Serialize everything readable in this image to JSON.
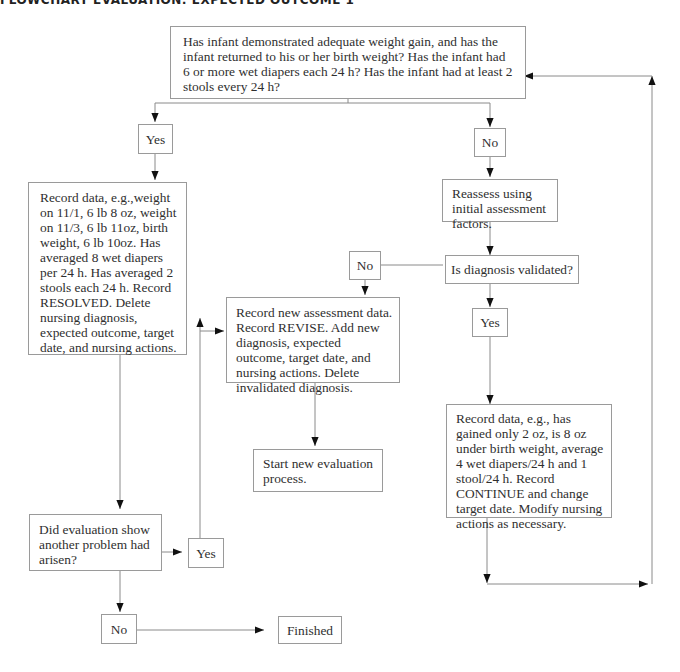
{
  "title": "FLOWCHART EVALUATION: EXPECTED OUTCOME 1",
  "nodes": {
    "question_main": "Has infant demonstrated adequate weight gain, and has the infant returned to his or her birth weight? Has the infant had 6 or more wet diapers each 24 h? Has the infant had at least 2 stools every 24 h?",
    "yes_1": "Yes",
    "no_1": "No",
    "record_resolved": "Record data, e.g.,weight on 11/1, 6 lb 8 oz, weight on 11/3, 6 lb 11oz, birth weight, 6 lb 10oz. Has averaged 8 wet diapers per 24 h. Has averaged 2 stools each 24 h. Record RESOLVED. Delete nursing diagnosis, expected outcome, target date, and nursing actions.",
    "reassess": "Reassess using initial assessment factors.",
    "diagnosis_validated": "Is diagnosis validated?",
    "no_2": "No",
    "yes_2": "Yes",
    "record_revise": "Record new assessment data. Record REVISE. Add new diagnosis, expected outcome, target date, and nursing actions. Delete invalidated diagnosis.",
    "start_new": "Start new evaluation process.",
    "record_continue": "Record data, e.g., has gained only 2 oz, is 8 oz under birth weight, average 4 wet diapers/24 h and 1 stool/24 h. Record CONTINUE and change target date. Modify nursing actions as necessary.",
    "another_problem": "Did evaluation show another problem had arisen?",
    "yes_3": "Yes",
    "no_3": "No",
    "finished": "Finished"
  },
  "colors": {
    "line": "#8a8a8a",
    "arrow": "#111111",
    "border": "#9a9a9a"
  }
}
